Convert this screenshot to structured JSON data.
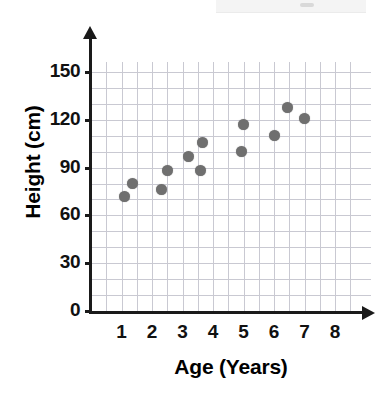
{
  "chart_data": {
    "type": "scatter",
    "title": "",
    "xlabel": "Age (Years)",
    "ylabel": "Height (cm)",
    "xlim": [
      0,
      8.6
    ],
    "ylim": [
      0,
      160
    ],
    "xticks": [
      "1",
      "2",
      "3",
      "4",
      "5",
      "6",
      "7",
      "8"
    ],
    "yticks": [
      "0",
      "30",
      "60",
      "90",
      "120",
      "150"
    ],
    "grid": true,
    "grid_step_x": 0.5,
    "grid_step_y": 10,
    "legend": "none",
    "marker_color": "#6f6f6f",
    "axis_color": "#1a1a1a",
    "grid_color": "#c9c9d2",
    "points": [
      {
        "x": 1.1,
        "y": 72
      },
      {
        "x": 1.35,
        "y": 80
      },
      {
        "x": 2.3,
        "y": 76
      },
      {
        "x": 2.5,
        "y": 88
      },
      {
        "x": 3.2,
        "y": 97
      },
      {
        "x": 3.6,
        "y": 88
      },
      {
        "x": 3.65,
        "y": 106
      },
      {
        "x": 4.95,
        "y": 100
      },
      {
        "x": 5.0,
        "y": 117
      },
      {
        "x": 6.0,
        "y": 110
      },
      {
        "x": 6.45,
        "y": 128
      },
      {
        "x": 7.0,
        "y": 121
      }
    ]
  }
}
